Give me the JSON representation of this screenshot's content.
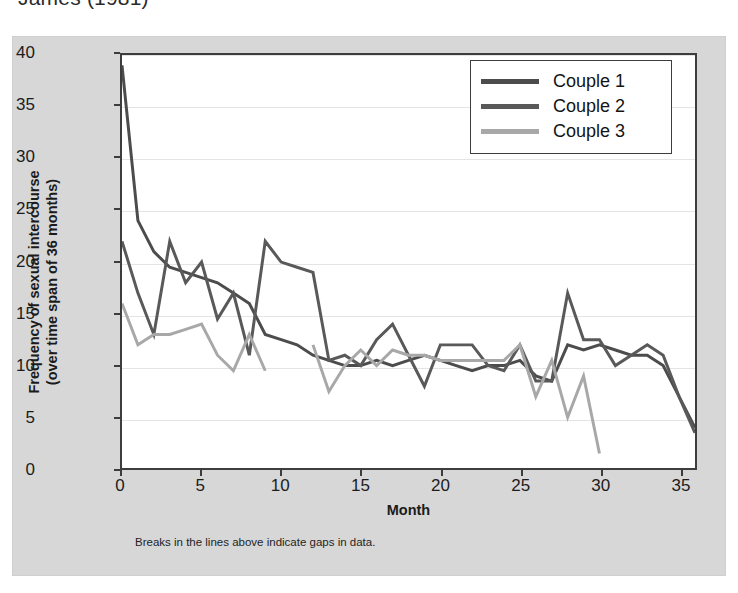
{
  "citation": "James (1981)",
  "chart_data": {
    "type": "line",
    "title": "",
    "xlabel": "Month",
    "ylabel_line1": "Frequency of sexual intercourse",
    "ylabel_line2": "(over time span of 36 months)",
    "footnote": "Breaks in the lines above indicate gaps in data.",
    "xlim": [
      0,
      36
    ],
    "ylim": [
      0,
      40
    ],
    "xticks": [
      0,
      5,
      10,
      15,
      20,
      25,
      30,
      35
    ],
    "yticks": [
      0,
      5,
      10,
      15,
      20,
      25,
      30,
      35,
      40
    ],
    "grid": true,
    "legend_position": "top-right",
    "colors": {
      "couple1": "#4c4c4c",
      "couple2": "#595959",
      "couple3": "#a8a8a8",
      "panel_background": "#d7d7d7",
      "plot_background": "#ffffff",
      "axis": "#3d3d3d",
      "gridline": "#e4e4e4"
    },
    "series": [
      {
        "name": "Couple 1",
        "color": "#4c4c4c",
        "segments": [
          {
            "x": [
              0,
              1,
              2,
              3,
              4,
              5,
              6,
              7,
              8,
              9,
              10,
              11,
              12,
              13,
              14,
              15,
              16,
              17,
              18,
              19,
              20,
              21,
              22,
              23,
              24,
              25,
              26,
              27,
              28,
              29,
              30,
              31,
              32,
              33,
              34,
              35,
              36
            ],
            "y": [
              39,
              24,
              21,
              19.5,
              19,
              18.5,
              18,
              17,
              16,
              13,
              12.5,
              12,
              11,
              10.5,
              10,
              10,
              10.5,
              10,
              10.5,
              11,
              10.5,
              10,
              9.5,
              10,
              10,
              10.5,
              9,
              8.5,
              12,
              11.5,
              12,
              11.5,
              11,
              11,
              10,
              7,
              4
            ]
          }
        ]
      },
      {
        "name": "Couple 2",
        "color": "#595959",
        "segments": [
          {
            "x": [
              0,
              1,
              2,
              3,
              4,
              5,
              6,
              7,
              8,
              9,
              10,
              11,
              12,
              13,
              14,
              15,
              16,
              17,
              18,
              19,
              20,
              21,
              22,
              23,
              24,
              25,
              26,
              27,
              28,
              29,
              30,
              31,
              32,
              33,
              34,
              35,
              36
            ],
            "y": [
              22,
              17,
              13,
              22,
              18,
              20,
              14.5,
              17,
              11,
              22,
              20,
              19.5,
              19,
              10.5,
              11,
              10,
              12.5,
              14,
              11,
              8,
              12,
              12,
              12,
              10,
              9.5,
              12,
              8.5,
              8.5,
              17,
              12.5,
              12.5,
              10,
              11,
              12,
              11,
              7,
              3.5
            ]
          }
        ]
      },
      {
        "name": "Couple 3",
        "color": "#a8a8a8",
        "segments": [
          {
            "x": [
              0,
              1,
              2,
              3,
              4,
              5,
              6,
              7,
              8,
              9
            ],
            "y": [
              16,
              12,
              13,
              13,
              13.5,
              14,
              11,
              9.5,
              13,
              9.5
            ]
          },
          {
            "x": [
              12,
              13,
              14,
              15,
              16,
              17,
              18,
              19,
              20,
              21,
              22,
              23,
              24,
              25,
              26,
              27,
              28,
              29,
              30
            ],
            "y": [
              12,
              7.5,
              10,
              11.5,
              10,
              11.5,
              11,
              11,
              10.5,
              10.5,
              10.5,
              10.5,
              10.5,
              12,
              7,
              10.5,
              5,
              9,
              1.5
            ]
          }
        ]
      }
    ]
  },
  "legend": {
    "items": [
      {
        "label": "Couple 1"
      },
      {
        "label": "Couple 2"
      },
      {
        "label": "Couple 3"
      }
    ]
  }
}
